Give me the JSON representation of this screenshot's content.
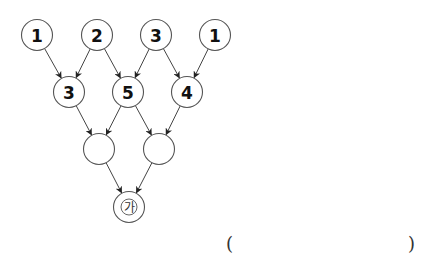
{
  "diagram": {
    "type": "addition-pyramid",
    "rows": [
      {
        "level": 1,
        "nodes": [
          {
            "id": "t1",
            "label": "1",
            "cx": 37,
            "cy": 35
          },
          {
            "id": "t2",
            "label": "2",
            "cx": 97,
            "cy": 35
          },
          {
            "id": "t3",
            "label": "3",
            "cx": 156,
            "cy": 35
          },
          {
            "id": "t4",
            "label": "1",
            "cx": 215,
            "cy": 35
          }
        ]
      },
      {
        "level": 2,
        "nodes": [
          {
            "id": "m1",
            "label": "3",
            "cx": 69,
            "cy": 92
          },
          {
            "id": "m2",
            "label": "5",
            "cx": 128,
            "cy": 92
          },
          {
            "id": "m3",
            "label": "4",
            "cx": 187,
            "cy": 92
          }
        ]
      },
      {
        "level": 3,
        "nodes": [
          {
            "id": "l1",
            "label": "",
            "cx": 99,
            "cy": 149
          },
          {
            "id": "l2",
            "label": "",
            "cx": 159,
            "cy": 149
          }
        ]
      },
      {
        "level": 4,
        "nodes": [
          {
            "id": "b1",
            "label": "",
            "marker": "가",
            "cx": 129,
            "cy": 207
          }
        ]
      }
    ],
    "edges": [
      [
        "t1",
        "m1"
      ],
      [
        "t2",
        "m1"
      ],
      [
        "t2",
        "m2"
      ],
      [
        "t3",
        "m2"
      ],
      [
        "t3",
        "m3"
      ],
      [
        "t4",
        "m3"
      ],
      [
        "m1",
        "l1"
      ],
      [
        "m2",
        "l1"
      ],
      [
        "m2",
        "l2"
      ],
      [
        "m3",
        "l2"
      ],
      [
        "l1",
        "b1"
      ],
      [
        "l2",
        "b1"
      ]
    ],
    "node_radius": 15.5
  },
  "answer": {
    "open_paren": "(",
    "close_paren": ")",
    "value": ""
  }
}
